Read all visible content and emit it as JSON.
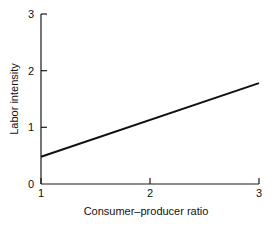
{
  "chart_data": {
    "type": "line",
    "title": "",
    "xlabel": "Consumer–producer ratio",
    "ylabel": "Labor intensity",
    "xlim": [
      1,
      3
    ],
    "ylim": [
      0,
      3
    ],
    "xticks": [
      1,
      2,
      3
    ],
    "xtick_labels": [
      "1",
      "2",
      "3"
    ],
    "yticks": [
      0,
      1,
      2,
      3
    ],
    "ytick_labels": [
      "0",
      "1",
      "2",
      "3"
    ],
    "grid": false,
    "legend": null,
    "series": [
      {
        "name": "Labor intensity",
        "color": "#111111",
        "x": [
          1,
          3
        ],
        "values": [
          0.48,
          1.78
        ]
      }
    ]
  },
  "axis": {
    "ytick_0": "0",
    "ytick_1": "1",
    "ytick_2": "2",
    "ytick_3": "3",
    "xtick_1": "1",
    "xtick_2": "2",
    "xtick_3": "3",
    "xlabel": "Consumer–producer ratio",
    "ylabel": "Labor intensity"
  }
}
